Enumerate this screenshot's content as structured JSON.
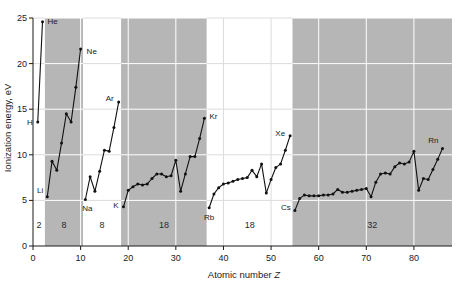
{
  "chart_data": {
    "type": "line",
    "title": "",
    "xlabel": "Atomic number Z",
    "ylabel": "Ionization energy, eV",
    "xlim": [
      0,
      88
    ],
    "ylim": [
      0,
      25
    ],
    "xticks": [
      0,
      10,
      20,
      30,
      40,
      50,
      60,
      70,
      80
    ],
    "yticks": [
      0,
      5,
      10,
      15,
      20,
      25
    ],
    "grid": true,
    "legend": "none",
    "series": [
      {
        "name": "First ionization energy",
        "x": [
          1,
          2,
          3,
          4,
          5,
          6,
          7,
          8,
          9,
          10,
          11,
          12,
          13,
          14,
          15,
          16,
          17,
          18,
          19,
          20,
          21,
          22,
          23,
          24,
          25,
          26,
          27,
          28,
          29,
          30,
          31,
          32,
          33,
          34,
          35,
          36,
          37,
          38,
          39,
          40,
          41,
          42,
          43,
          44,
          45,
          46,
          47,
          48,
          49,
          50,
          51,
          52,
          53,
          54,
          55,
          56,
          57,
          58,
          59,
          60,
          61,
          62,
          63,
          64,
          65,
          66,
          67,
          68,
          69,
          70,
          71,
          72,
          73,
          74,
          75,
          76,
          77,
          78,
          79,
          80,
          81,
          82,
          83,
          84,
          85,
          86
        ],
        "values": [
          13.6,
          24.6,
          5.4,
          9.3,
          8.3,
          11.3,
          14.5,
          13.6,
          17.4,
          21.6,
          5.1,
          7.6,
          6.0,
          8.2,
          10.5,
          10.4,
          13.0,
          15.8,
          4.3,
          6.1,
          6.5,
          6.8,
          6.7,
          6.8,
          7.4,
          7.9,
          7.9,
          7.6,
          7.7,
          9.4,
          6.0,
          7.9,
          9.8,
          9.8,
          11.8,
          14.0,
          4.2,
          5.7,
          6.4,
          6.8,
          6.9,
          7.1,
          7.3,
          7.4,
          7.5,
          8.3,
          7.6,
          9.0,
          5.8,
          7.3,
          8.6,
          9.0,
          10.5,
          12.1,
          3.9,
          5.2,
          5.6,
          5.5,
          5.5,
          5.5,
          5.6,
          5.6,
          5.7,
          6.2,
          5.9,
          5.9,
          6.0,
          6.1,
          6.2,
          6.3,
          5.4,
          7.0,
          7.9,
          8.0,
          7.9,
          8.7,
          9.1,
          9.0,
          9.2,
          10.4,
          6.1,
          7.4,
          7.3,
          8.4,
          9.5,
          10.7
        ]
      }
    ],
    "point_labels": [
      {
        "symbol": "H",
        "z": 1,
        "value": 13.6,
        "anchor": "end",
        "dx": -5,
        "dy": 3
      },
      {
        "symbol": "He",
        "z": 2,
        "value": 24.6,
        "anchor": "start",
        "dx": 5,
        "dy": 2
      },
      {
        "symbol": "Li",
        "z": 3,
        "value": 5.4,
        "anchor": "end",
        "dx": -4,
        "dy": -4
      },
      {
        "symbol": "Ne",
        "z": 10,
        "value": 21.6,
        "anchor": "start",
        "dx": 6,
        "dy": 5
      },
      {
        "symbol": "Na",
        "z": 11,
        "value": 5.1,
        "anchor": "middle",
        "dx": 2,
        "dy": 12
      },
      {
        "symbol": "Ar",
        "z": 18,
        "value": 15.8,
        "anchor": "end",
        "dx": -5,
        "dy": -1
      },
      {
        "symbol": "K",
        "z": 19,
        "value": 4.3,
        "anchor": "end",
        "dx": -5,
        "dy": 1
      },
      {
        "symbol": "Kr",
        "z": 36,
        "value": 14.0,
        "anchor": "start",
        "dx": 5,
        "dy": 1
      },
      {
        "symbol": "Rb",
        "z": 37,
        "value": 4.2,
        "anchor": "middle",
        "dx": 0,
        "dy": 12
      },
      {
        "symbol": "Xe",
        "z": 54,
        "value": 12.1,
        "anchor": "end",
        "dx": -5,
        "dy": 0
      },
      {
        "symbol": "Cs",
        "z": 55,
        "value": 3.9,
        "anchor": "end",
        "dx": -4,
        "dy": 0
      },
      {
        "symbol": "Rn",
        "z": 86,
        "value": 10.7,
        "anchor": "end",
        "dx": -4,
        "dy": -5
      }
    ],
    "period_bands": [
      {
        "label": "2",
        "z_start": 0,
        "z_end": 2,
        "shaded": false
      },
      {
        "label": "8",
        "z_start": 3,
        "z_end": 10,
        "shaded": true
      },
      {
        "label": "8",
        "z_start": 11,
        "z_end": 18,
        "shaded": false
      },
      {
        "label": "18",
        "z_start": 19,
        "z_end": 36,
        "shaded": true
      },
      {
        "label": "18",
        "z_start": 37,
        "z_end": 54,
        "shaded": false
      },
      {
        "label": "32",
        "z_start": 55,
        "z_end": 88,
        "shaded": true
      }
    ],
    "colors": {
      "band_shaded": "#b6b6b6",
      "band_plain": "#ffffff",
      "line": "#111111",
      "marker": "#111111",
      "grid_on_shade": "#ffffff",
      "grid_on_plain": "#dcdcdc",
      "axis": "#1a1a1a",
      "text": "#1a1a1a"
    }
  }
}
